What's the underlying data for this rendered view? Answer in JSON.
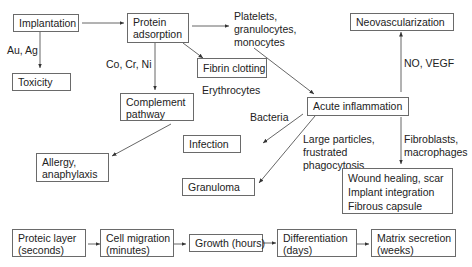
{
  "diagram": {
    "nodes": {
      "implantation": "Implantation",
      "protein_adsorption": [
        "Protein",
        "adsorption"
      ],
      "toxicity": "Toxicity",
      "fibrin_clotting": "Fibrin clotting",
      "complement_pathway": [
        "Complement",
        "pathway"
      ],
      "allergy": [
        "Allergy,",
        "anaphylaxis"
      ],
      "neovascularization": "Neovascularization",
      "acute_inflammation": "Acute inflammation",
      "infection": "Infection",
      "granuloma": "Granuloma",
      "outcomes": [
        "Wound healing, scar",
        "Implant integration",
        "Fibrous capsule"
      ]
    },
    "labels": {
      "au_ag": "Au, Ag",
      "co_cr_ni": "Co, Cr, Ni",
      "erythrocytes": "Erythrocytes",
      "cells": [
        "Platelets,",
        "granulocytes,",
        "monocytes"
      ],
      "no_vegf": "NO, VEGF",
      "bacteria": "Bacteria",
      "large_particles": [
        "Large particles,",
        "frustrated",
        "phagocytosis"
      ],
      "fibroblasts": [
        "Fibroblasts,",
        "macrophages"
      ]
    },
    "timeline": [
      [
        "Proteic layer",
        "(seconds)"
      ],
      [
        "Cell migration",
        "(minutes)"
      ],
      [
        "Growth (hours)"
      ],
      [
        "Differentiation",
        "(days)"
      ],
      [
        "Matrix secretion",
        "(weeks)"
      ]
    ],
    "colors": {
      "line": "#555555",
      "border": "#6a6a6a",
      "text": "#222222"
    }
  }
}
